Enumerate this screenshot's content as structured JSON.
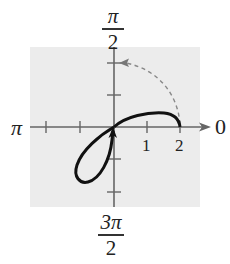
{
  "diagram": {
    "type": "polar-graph",
    "angle_labels": {
      "top": {
        "numerator": "π",
        "denominator": "2"
      },
      "bottom": {
        "numerator": "3π",
        "denominator": "2"
      },
      "left": "π",
      "right": "0"
    },
    "radial_tick_labels": [
      "1",
      "2"
    ],
    "colors": {
      "background": "#ffffff",
      "grid_panel": "#ececec",
      "axis": "#666666",
      "curve": "#111111",
      "dashed_arc": "#888888"
    },
    "elements": {
      "solid_curve": "closed curve passing through pole with loop in third quadrant and arc in first quadrant ending at r=2 on polar axis",
      "dashed_arc": "dashed quarter-circle arc from r=2 at angle 0 toward angle π/2 with arrowhead",
      "direction_arrow": "arrowhead on curve near pole pointing upward"
    }
  }
}
